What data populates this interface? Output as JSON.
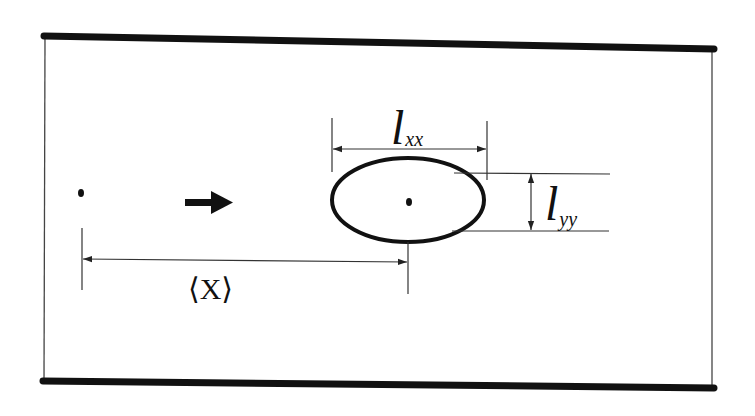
{
  "figure": {
    "type": "channel-droplet-schematic",
    "colors": {
      "background": "#ffffff",
      "ink": "#111111",
      "thin_line": "#333333"
    },
    "elements": {
      "channel_walls": [
        "top-wall",
        "bottom-wall"
      ],
      "reference_point": "origin-dot",
      "flow_direction": "right-arrow",
      "droplet": "ellipse-with-center-dot"
    }
  },
  "labels": {
    "lxx": {
      "symbol": "l",
      "subscript": "xx"
    },
    "lyy": {
      "symbol": "l",
      "subscript": "yy"
    },
    "x_mean": "⟨X⟩"
  }
}
